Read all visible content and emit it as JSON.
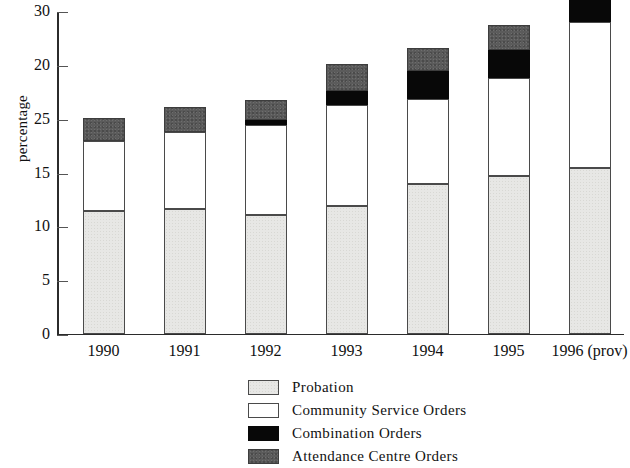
{
  "chart_data": {
    "type": "bar",
    "stacked": true,
    "title": "",
    "xlabel": "",
    "ylabel": "percentage",
    "ylim": [
      0,
      30
    ],
    "ytick_labels": [
      "30",
      "20",
      "25",
      "15",
      "10",
      "5",
      "0"
    ],
    "ytick_values": [
      30,
      25,
      20,
      15,
      10,
      5,
      0
    ],
    "grid": false,
    "legend_position": "bottom-center",
    "categories": [
      "1990",
      "1991",
      "1992",
      "1993",
      "1994",
      "1995",
      "1996 (prov)"
    ],
    "series": [
      {
        "name": "Probation",
        "color": "#e7e7e5",
        "values": [
          11.4,
          11.6,
          11.0,
          11.8,
          13.9,
          14.6,
          15.4
        ]
      },
      {
        "name": "Community Service Orders",
        "color": "#ffffff",
        "values": [
          6.5,
          7.1,
          8.4,
          9.4,
          7.9,
          9.1,
          13.5
        ]
      },
      {
        "name": "Combination Orders",
        "color": "#080808",
        "values": [
          0.0,
          0.0,
          0.4,
          1.3,
          2.6,
          2.6,
          3.3
        ]
      },
      {
        "name": "Attendance Centre Orders",
        "color": "#5b5b5b",
        "values": [
          2.1,
          2.3,
          1.9,
          2.5,
          2.1,
          2.4,
          2.8
        ]
      }
    ],
    "totals": [
      20.0,
      21.0,
      21.7,
      25.0,
      26.5,
      28.7,
      35.0
    ]
  },
  "axis": {
    "y_title": "percentage",
    "y_ticks": [
      {
        "label": "30",
        "pos": 30
      },
      {
        "label": "20",
        "pos": 25
      },
      {
        "label": "25",
        "pos": 20
      },
      {
        "label": "15",
        "pos": 15
      },
      {
        "label": "10",
        "pos": 10
      },
      {
        "label": "5",
        "pos": 5
      },
      {
        "label": "0",
        "pos": 0
      }
    ],
    "x_labels": [
      "1990",
      "1991",
      "1992",
      "1993",
      "1994",
      "1995",
      "1996 (prov)"
    ]
  },
  "legend": {
    "items": [
      {
        "label": "Probation",
        "swatch": "probation"
      },
      {
        "label": "Community Service Orders",
        "swatch": "cso"
      },
      {
        "label": "Combination Orders",
        "swatch": "comb"
      },
      {
        "label": "Attendance Centre Orders",
        "swatch": "aco"
      }
    ]
  }
}
